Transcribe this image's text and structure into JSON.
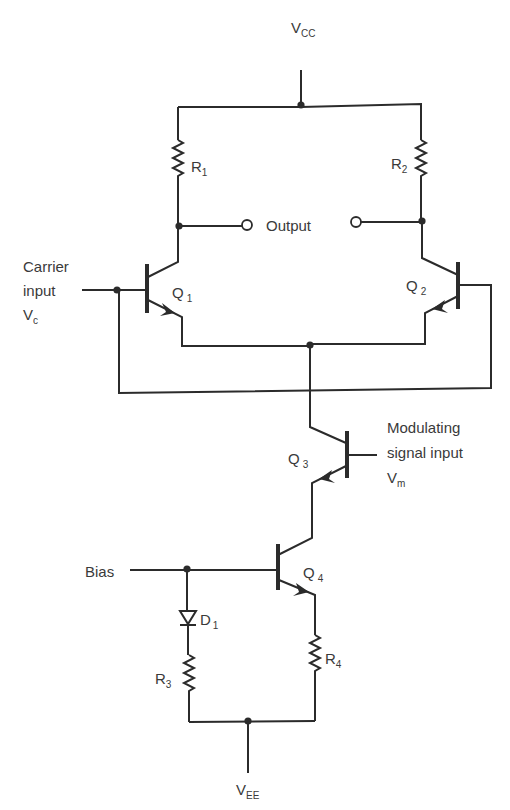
{
  "diagram": {
    "type": "circuit-schematic",
    "supply": {
      "top": "V",
      "top_sub": "CC",
      "bottom": "V",
      "bottom_sub": "EE"
    },
    "output_label": "Output",
    "inputs": {
      "carrier": {
        "line1": "Carrier",
        "line2": "input",
        "line3": "V",
        "line3_sub": "c"
      },
      "modulating": {
        "line1": "Modulating",
        "line2": "signal input",
        "line3": "V",
        "line3_sub": "m"
      },
      "bias": "Bias"
    },
    "components": {
      "R1": {
        "letter": "R",
        "sub": "1"
      },
      "R2": {
        "letter": "R",
        "sub": "2"
      },
      "R3": {
        "letter": "R",
        "sub": "3"
      },
      "R4": {
        "letter": "R",
        "sub": "4"
      },
      "D1": {
        "letter": "D",
        "sub": "1"
      },
      "Q1": {
        "letter": "Q",
        "sub": "1"
      },
      "Q2": {
        "letter": "Q",
        "sub": "2"
      },
      "Q3": {
        "letter": "Q",
        "sub": "3"
      },
      "Q4": {
        "letter": "Q",
        "sub": "4"
      }
    },
    "colors": {
      "ink": "#2b2b2b",
      "text": "#3a3a3a",
      "background": "#ffffff"
    }
  }
}
